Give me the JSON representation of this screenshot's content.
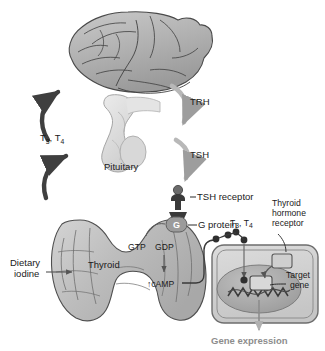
{
  "figure": {
    "background_color": "#ffffff"
  },
  "anatomy": {
    "brain_label": "",
    "pituitary_label": "Pituitary",
    "thyroid_label": "Thyroid"
  },
  "labels": {
    "trh": "TRH",
    "tsh": "TSH",
    "feedback_hormones": "T",
    "feedback_sub_3": "3",
    "feedback_comma": ", T",
    "feedback_sub_4": "4",
    "dietary_iodine_line1": "Dietary",
    "dietary_iodine_line2": "iodine",
    "tsh_receptor": "TSH receptor",
    "g_protein": "G protein",
    "g_letter": "G",
    "gtp": "GTP",
    "gdp": "GDP",
    "camp": "↑cAMP",
    "circulating_t3t4": "T",
    "circulating_sub_3": "3",
    "circulating_comma": ", T",
    "circulating_sub_4": "4",
    "thyroid_hormone_receptor_line1": "Thyroid",
    "thyroid_hormone_receptor_line2": "hormone",
    "thyroid_hormone_receptor_line3": "receptor",
    "target_gene_line1": "Target",
    "target_gene_line2": "gene",
    "gene_expression": "Gene expression"
  },
  "colors": {
    "brain_fill": "#b4b4b4",
    "brain_stroke": "#4a4a4a",
    "pituitary_fill": "#dcdcdc",
    "pituitary_stroke": "#9a9a9a",
    "thyroid_fill": "#c4c4c4",
    "thyroid_stroke": "#4f4f4f",
    "cell_fill": "#d2d2d2",
    "cell_stroke": "#6e6e6e",
    "nucleus_fill": "#a9a9a9",
    "receptor_dark": "#3a3a3a",
    "arrow_gray": "#b0b0b0",
    "arrow_dark": "#3f3f3f",
    "text": "#1a1a1a",
    "text_gray": "#8d8d8d"
  }
}
